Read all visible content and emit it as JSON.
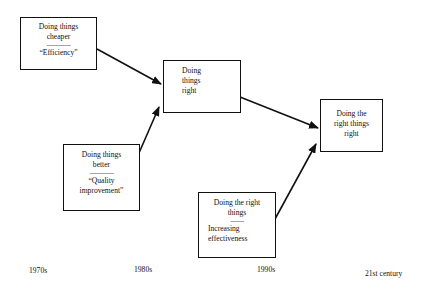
{
  "diagram": {
    "type": "flow",
    "boxes": [
      {
        "id": "efficiency",
        "lines": [
          "Doing things",
          "cheaper"
        ],
        "separator": "----------------",
        "sublines": [
          "“Efficiency”"
        ]
      },
      {
        "id": "doing-things-right",
        "lines": [
          "Doing",
          "things",
          "right"
        ],
        "separator": "",
        "sublines": []
      },
      {
        "id": "doing-right-things-right",
        "lines": [
          "Doing the",
          "right things",
          "right"
        ],
        "separator": "",
        "sublines": []
      },
      {
        "id": "quality-improvement",
        "lines": [
          "Doing things",
          "better"
        ],
        "separator": "----------------",
        "sublines": [
          "“Quality",
          "improvement”"
        ]
      },
      {
        "id": "effectiveness",
        "lines": [
          "Doing the right",
          "things"
        ],
        "separator": "---------",
        "sublines": [
          "Increasing",
          "effectiveness"
        ]
      }
    ],
    "arrows": [
      {
        "from": "efficiency",
        "to": "doing-things-right"
      },
      {
        "from": "quality-improvement",
        "to": "doing-things-right"
      },
      {
        "from": "doing-things-right",
        "to": "doing-right-things-right"
      },
      {
        "from": "effectiveness",
        "to": "doing-right-things-right"
      }
    ],
    "timeline": [
      "1970s",
      "1980s",
      "1990s",
      "21st century"
    ],
    "colors": {
      "stroke": "#111111",
      "background": "#ffffff"
    }
  }
}
